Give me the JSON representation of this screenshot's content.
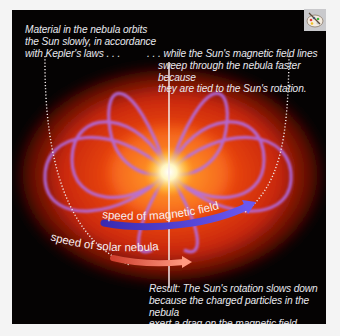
{
  "figure": {
    "caption_left": {
      "lines": [
        "Material in the nebula orbits",
        "the Sun slowly, in accordance",
        "with Kepler's laws . . ."
      ]
    },
    "caption_right": {
      "lines": [
        ". . . while the Sun's magnetic field lines",
        "sweep through the nebula faster because",
        "they are tied to the Sun's rotation."
      ]
    },
    "labels": {
      "magnetic": "speed of magnetic field",
      "nebula": "speed of solar nebula"
    },
    "caption_result": {
      "lines": [
        "Result: The Sun's rotation slows down",
        "because the charged particles in the nebula",
        "exert a drag on the magnetic field."
      ]
    },
    "colors": {
      "background": "#050303",
      "nebula": "#e0300c",
      "field_lines": "#b070f0",
      "magnetic_arrow": "#4a3ad0",
      "nebula_arrow": "#f08060",
      "sun_core": "#fffbe0"
    },
    "icon": "palette-icon"
  }
}
